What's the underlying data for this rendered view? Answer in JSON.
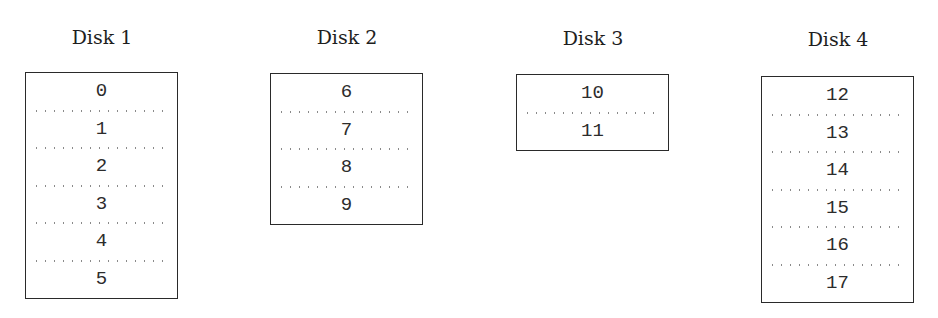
{
  "figure": {
    "disks": [
      {
        "title": "Disk 1",
        "blocks": [
          "0",
          "1",
          "2",
          "3",
          "4",
          "5"
        ]
      },
      {
        "title": "Disk 2",
        "blocks": [
          "6",
          "7",
          "8",
          "9"
        ]
      },
      {
        "title": "Disk 3",
        "blocks": [
          "10",
          "11"
        ]
      },
      {
        "title": "Disk 4",
        "blocks": [
          "12",
          "13",
          "14",
          "15",
          "16",
          "17"
        ]
      }
    ]
  },
  "colors": {
    "border": "#2a2a2a",
    "text": "#2c2c2c",
    "divider_dots": "#8a8a8a",
    "background": "#ffffff"
  }
}
